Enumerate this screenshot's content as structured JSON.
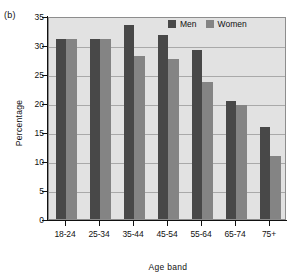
{
  "panel": {
    "letter": "(b)"
  },
  "chart_data": {
    "type": "bar",
    "title": "",
    "panel_label": "(b)",
    "xlabel": "Age band",
    "ylabel": "Percentage",
    "ylim": [
      0,
      35
    ],
    "yticks": [
      0,
      5,
      10,
      15,
      20,
      25,
      30,
      35
    ],
    "ytick_labels": [
      "0",
      "5",
      "10",
      "15",
      "20",
      "25",
      "30",
      "35"
    ],
    "grid": true,
    "legend_position": "top-right",
    "categories": [
      "18-24",
      "25-34",
      "35-44",
      "45-54",
      "55-64",
      "65-74",
      "75+"
    ],
    "series": [
      {
        "name": "Men",
        "color": "#484848",
        "values": [
          31.0,
          31.0,
          33.5,
          31.7,
          29.2,
          20.3,
          15.8
        ]
      },
      {
        "name": "Women",
        "color": "#848484",
        "values": [
          31.0,
          31.0,
          28.1,
          27.6,
          23.7,
          19.6,
          10.9
        ]
      }
    ]
  },
  "colors": {
    "plot_background": "#e2e2e2",
    "gridline": "#a9a9a9",
    "axis": "#111111",
    "men": "#484848",
    "women": "#848484"
  }
}
